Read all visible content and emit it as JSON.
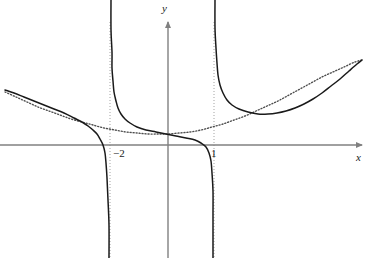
{
  "figure": {
    "width": 369,
    "height": 258,
    "background": "#ffffff"
  },
  "axes": {
    "x_axis_label": "x",
    "y_axis_label": "y",
    "origin_px": [
      168,
      145
    ],
    "unit_px_x": 29,
    "axis_color": "#808080",
    "x_axis_y_px": 145,
    "y_axis_x_px": 168,
    "x_axis_extent_px": [
      0,
      362
    ],
    "y_axis_extent_px": [
      22,
      258
    ],
    "arrowheads": [
      "x-right",
      "y-up"
    ]
  },
  "ticks": {
    "labels": [
      "−2",
      "1"
    ],
    "values": [
      -2,
      1
    ],
    "x_px": [
      110,
      214
    ]
  },
  "chart_data": {
    "type": "line",
    "title": "",
    "xlabel": "x",
    "ylabel": "y",
    "grid": false,
    "legend": "none",
    "xlim": [
      -5.8,
      6.7
    ],
    "ylim": [
      -3.9,
      4.2
    ],
    "annotations": [
      "−2",
      "1"
    ],
    "series": [
      {
        "name": "solid-curve",
        "style": "solid",
        "color": "#1a1a1a",
        "description": "rational function with vertical asymptotes at x=-2 and x=1, approaching the dotted curve far from the asymptotes",
        "vertical_asymptotes": [
          -2,
          1
        ],
        "branches": [
          {
            "name": "left-branch",
            "points_px": [
              [
                5,
                90
              ],
              [
                14,
                93
              ],
              [
                24,
                97
              ],
              [
                34,
                101
              ],
              [
                44,
                105
              ],
              [
                54,
                109
              ],
              [
                64,
                113
              ],
              [
                74,
                118
              ],
              [
                82,
                122
              ],
              [
                88,
                126
              ],
              [
                93,
                130
              ],
              [
                97,
                134
              ],
              [
                100,
                139
              ],
              [
                103,
                145
              ],
              [
                105,
                153
              ],
              [
                106,
                163
              ],
              [
                107,
                178
              ],
              [
                108,
                200
              ],
              [
                109,
                225
              ],
              [
                109,
                258
              ]
            ]
          },
          {
            "name": "middle-branch",
            "points_px": [
              [
                111,
                0
              ],
              [
                111,
                30
              ],
              [
                112,
                52
              ],
              [
                112,
                68
              ],
              [
                113,
                81
              ],
              [
                114,
                92
              ],
              [
                116,
                101
              ],
              [
                118,
                108
              ],
              [
                121,
                114
              ],
              [
                125,
                119
              ],
              [
                130,
                123
              ],
              [
                137,
                127
              ],
              [
                146,
                130
              ],
              [
                156,
                132
              ],
              [
                166,
                134
              ],
              [
                176,
                136
              ],
              [
                186,
                138
              ],
              [
                195,
                140
              ],
              [
                201,
                143
              ],
              [
                206,
                147
              ],
              [
                209,
                153
              ],
              [
                211,
                161
              ],
              [
                212,
                173
              ],
              [
                213,
                191
              ],
              [
                213,
                216
              ],
              [
                213,
                258
              ]
            ]
          },
          {
            "name": "right-branch",
            "points_px": [
              [
                215,
                0
              ],
              [
                215,
                28
              ],
              [
                216,
                48
              ],
              [
                217,
                63
              ],
              [
                218,
                75
              ],
              [
                220,
                85
              ],
              [
                223,
                93
              ],
              [
                227,
                100
              ],
              [
                232,
                105
              ],
              [
                239,
                109
              ],
              [
                248,
                112
              ],
              [
                258,
                114
              ],
              [
                268,
                114
              ],
              [
                277,
                113
              ],
              [
                286,
                111
              ],
              [
                295,
                108
              ],
              [
                304,
                104
              ],
              [
                313,
                99
              ],
              [
                322,
                93
              ],
              [
                331,
                86
              ],
              [
                340,
                79
              ],
              [
                349,
                71
              ],
              [
                357,
                64
              ],
              [
                362,
                60
              ]
            ]
          }
        ]
      },
      {
        "name": "dotted-asymptote-curve",
        "style": "dotted",
        "color": "#4d4d4d",
        "description": "smooth curvilinear asymptote that the solid curve approaches as x goes to plus or minus infinity",
        "points_px": [
          [
            5,
            92
          ],
          [
            16,
            97
          ],
          [
            27,
            102
          ],
          [
            38,
            107
          ],
          [
            49,
            111
          ],
          [
            60,
            115
          ],
          [
            71,
            119
          ],
          [
            82,
            122
          ],
          [
            93,
            125
          ],
          [
            104,
            128
          ],
          [
            115,
            130
          ],
          [
            126,
            132
          ],
          [
            137,
            133
          ],
          [
            148,
            134
          ],
          [
            159,
            134
          ],
          [
            168,
            134
          ],
          [
            179,
            133
          ],
          [
            190,
            132
          ],
          [
            201,
            130
          ],
          [
            212,
            127
          ],
          [
            223,
            124
          ],
          [
            234,
            120
          ],
          [
            245,
            116
          ],
          [
            256,
            111
          ],
          [
            267,
            106
          ],
          [
            278,
            101
          ],
          [
            289,
            95
          ],
          [
            300,
            89
          ],
          [
            311,
            83
          ],
          [
            322,
            77
          ],
          [
            333,
            72
          ],
          [
            344,
            67
          ],
          [
            355,
            62
          ],
          [
            362,
            60
          ]
        ]
      }
    ],
    "asymptote_guides": [
      {
        "name": "vertical-asymptote-neg2",
        "x_px": 110,
        "style": "dotted",
        "color": "#999999",
        "y_extent_px": [
          22,
          258
        ]
      },
      {
        "name": "vertical-asymptote-one",
        "x_px": 214,
        "style": "dotted",
        "color": "#999999",
        "y_extent_px": [
          22,
          258
        ]
      }
    ]
  },
  "colors": {
    "curve_solid": "#1a1a1a",
    "curve_dotted": "#4d4d4d",
    "axis": "#808080",
    "asymptote_guide": "#999999",
    "text": "#1a1a1a",
    "background": "#ffffff"
  }
}
